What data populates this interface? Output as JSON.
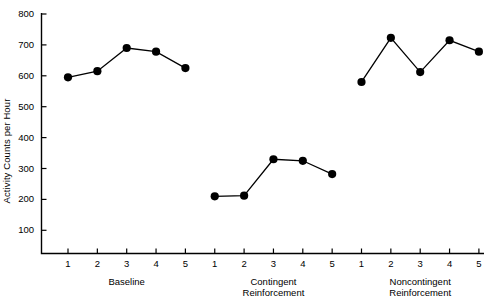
{
  "chart_data": {
    "type": "line",
    "title": "",
    "xlabel": "",
    "ylabel": "Activity Counts per Hour",
    "ylim": [
      0,
      800
    ],
    "yticks": [
      100,
      200,
      300,
      400,
      500,
      600,
      700,
      800
    ],
    "ytick_labels": [
      "100",
      "200",
      "300",
      "400",
      "500",
      "600",
      "700",
      "800"
    ],
    "grid": false,
    "legend": "none",
    "marker": "filled-circle",
    "line_color": "#000000",
    "marker_color": "#000000",
    "axis_color": "#000000",
    "background": "#ffffff",
    "x": [
      1,
      2,
      3,
      4,
      5,
      6,
      7,
      8,
      9,
      10,
      11,
      12,
      13,
      14,
      15
    ],
    "xtick_labels": [
      "1",
      "2",
      "3",
      "4",
      "5",
      "1",
      "2",
      "3",
      "4",
      "5",
      "1",
      "2",
      "3",
      "4",
      "5"
    ],
    "phases": [
      {
        "name": "Baseline",
        "label_lines": [
          "Baseline"
        ],
        "x": [
          1,
          2,
          3,
          4,
          5
        ],
        "tick_labels": [
          "1",
          "2",
          "3",
          "4",
          "5"
        ],
        "values": [
          595,
          615,
          690,
          678,
          625
        ]
      },
      {
        "name": "Contingent Reinforcement",
        "label_lines": [
          "Contingent",
          "Reinforcement"
        ],
        "x": [
          1,
          2,
          3,
          4,
          5
        ],
        "tick_labels": [
          "1",
          "2",
          "3",
          "4",
          "5"
        ],
        "values": [
          210,
          212,
          330,
          325,
          282
        ]
      },
      {
        "name": "Noncontingent Reinforcement",
        "label_lines": [
          "Noncontingent",
          "Reinforcement"
        ],
        "x": [
          1,
          2,
          3,
          4,
          5
        ],
        "tick_labels": [
          "1",
          "2",
          "3",
          "4",
          "5"
        ],
        "values": [
          580,
          723,
          612,
          715,
          678
        ]
      }
    ],
    "series": [
      {
        "name": "Activity Counts per Hour",
        "values": [
          595,
          615,
          690,
          678,
          625,
          210,
          212,
          330,
          325,
          282,
          580,
          723,
          612,
          715,
          678
        ]
      }
    ]
  }
}
